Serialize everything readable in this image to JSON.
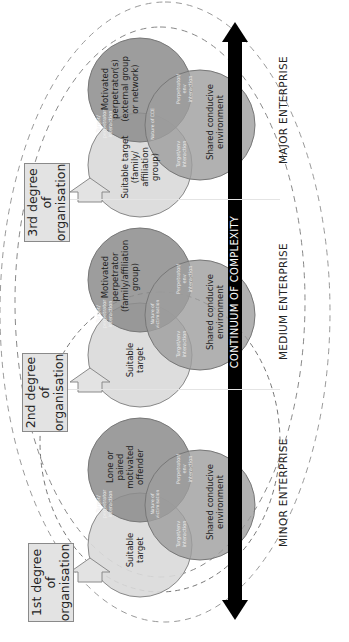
{
  "axis": {
    "label": "CONTINUUM OF COMPLEXITY",
    "direction": "left-to-right (bottom-to-top on page)"
  },
  "panels": [
    {
      "degree_label": "1st degree of organisation",
      "enterprise_label": "MINOR ENTERPRISE",
      "circles": {
        "target": "Suitable target",
        "perpetrator": "Lone or paired motivated offender",
        "environment": "Shared conducive environment"
      },
      "intersections": {
        "target_perpetrator": "Target/ perpetrator interaction",
        "perpetrator_env": "Perpetrator/ env interaction",
        "target_env": "Target/env interaction",
        "centre": "Nature of victimisation"
      }
    },
    {
      "degree_label": "2nd degree of organisation",
      "enterprise_label": "MEDIUM ENTERPRISE",
      "circles": {
        "target": "Suitable target",
        "perpetrator": "Motivated perpetrator (family/affiliation group)",
        "environment": "Shared conducive environment"
      },
      "intersections": {
        "target_perpetrator": "Target/ perpetrator interaction",
        "perpetrator_env": "Perpetrator/ env interaction",
        "target_env": "Target/env interaction",
        "centre": "Nature of victimisation"
      }
    },
    {
      "degree_label": "3rd degree of organisation",
      "enterprise_label": "MAJOR ENTERPRISE",
      "circles": {
        "target": "Suitable target (family/ affiliation group)",
        "perpetrator": "Motivated perpetrator(s) (external group or network)",
        "environment": "Shared conducive environment"
      },
      "intersections": {
        "target_perpetrator": "Target/ perpetrator interaction",
        "perpetrator_env": "Perpetrator/ env interaction",
        "target_env": "Target/env interaction",
        "centre": "Nature of CCE"
      }
    }
  ],
  "colors": {
    "target_fill": "#d9d9d9",
    "perpetrator_fill": "#8c8c8c",
    "environment_fill": "#9e9e9e",
    "arrow": "#000000",
    "box_fill": "#e3e3e3"
  }
}
